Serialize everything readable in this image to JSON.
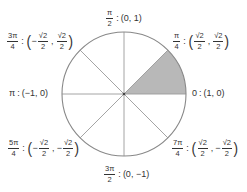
{
  "diagram": {
    "type": "unit-circle",
    "center": [
      124,
      94
    ],
    "radius": 62,
    "shaded_sector": {
      "from_angle": "0",
      "to_angle": "π/4",
      "color": "#b8b8b8"
    },
    "circle_color": "#888888",
    "ray_color": "#9a9a9a"
  },
  "labels": {
    "pi_over_2": {
      "angle_num": "π",
      "angle_den": "2",
      "sep": ":",
      "coord": "(0, 1)"
    },
    "pi_over_4": {
      "angle_num": "π",
      "angle_den": "4",
      "sep": ":",
      "x_num": "√2",
      "x_den": "2",
      "x_sign": "",
      "y_num": "√2",
      "y_den": "2",
      "y_sign": ""
    },
    "three_pi_over_4": {
      "angle_num": "3π",
      "angle_den": "4",
      "sep": ":",
      "x_num": "√2",
      "x_den": "2",
      "x_sign": "−",
      "y_num": "√2",
      "y_den": "2",
      "y_sign": ""
    },
    "pi": {
      "angle": "π",
      "sep": ":",
      "coord": "(−1, 0)"
    },
    "zero": {
      "angle": "0",
      "sep": ":",
      "coord": "(1, 0)"
    },
    "five_pi_over_4": {
      "angle_num": "5π",
      "angle_den": "4",
      "sep": ":",
      "x_num": "√2",
      "x_den": "2",
      "x_sign": "−",
      "y_num": "√2",
      "y_den": "2",
      "y_sign": "−"
    },
    "seven_pi_over_4": {
      "angle_num": "7π",
      "angle_den": "4",
      "sep": ":",
      "x_num": "√2",
      "x_den": "2",
      "x_sign": "",
      "y_num": "√2",
      "y_den": "2",
      "y_sign": "−"
    },
    "three_pi_over_2": {
      "angle_num": "3π",
      "angle_den": "2",
      "sep": ":",
      "coord": "(0, −1)"
    }
  },
  "punct": {
    "open": "(",
    "close": ")",
    "comma": ","
  }
}
